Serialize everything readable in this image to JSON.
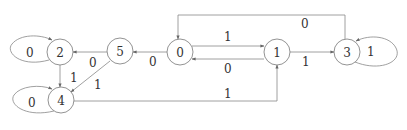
{
  "diagram": {
    "type": "state-machine",
    "nodes": [
      {
        "id": "2",
        "label": "2",
        "cx": 60,
        "cy": 52
      },
      {
        "id": "4",
        "label": "4",
        "cx": 61,
        "cy": 100
      },
      {
        "id": "5",
        "label": "5",
        "cx": 120,
        "cy": 51
      },
      {
        "id": "0",
        "label": "0",
        "cx": 180,
        "cy": 52
      },
      {
        "id": "1",
        "label": "1",
        "cx": 277,
        "cy": 52
      },
      {
        "id": "3",
        "label": "3",
        "cx": 347,
        "cy": 52
      }
    ],
    "edges": [
      {
        "from": "2",
        "to": "2",
        "label": "0"
      },
      {
        "from": "4",
        "to": "4",
        "label": "0"
      },
      {
        "from": "2",
        "to": "4",
        "label": "1"
      },
      {
        "from": "5",
        "to": "2",
        "label": "0"
      },
      {
        "from": "5",
        "to": "4",
        "label": "1"
      },
      {
        "from": "0",
        "to": "5",
        "label": "0"
      },
      {
        "from": "0",
        "to": "1",
        "label": "1"
      },
      {
        "from": "1",
        "to": "0",
        "label": "0"
      },
      {
        "from": "1",
        "to": "3",
        "label": "1"
      },
      {
        "from": "3",
        "to": "3",
        "label": "1"
      },
      {
        "from": "3",
        "to": "0",
        "label": "0"
      },
      {
        "from": "4",
        "to": "1",
        "label": "1"
      }
    ]
  }
}
